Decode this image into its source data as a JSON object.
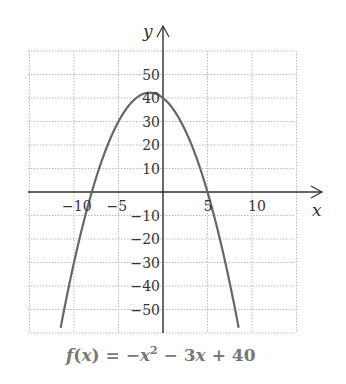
{
  "chart_data": {
    "type": "line",
    "title": "",
    "caption": "f(x) = −x² − 3x + 40",
    "function": "f(x) = -x^2 - 3x + 40",
    "xlabel": "x",
    "ylabel": "y",
    "xlim": [
      -15,
      15
    ],
    "ylim": [
      -60,
      60
    ],
    "x_ticks": [
      -10,
      -5,
      5,
      10
    ],
    "x_tick_labels": [
      "−10",
      "−5",
      "5",
      "10"
    ],
    "y_ticks": [
      50,
      40,
      30,
      20,
      10,
      -10,
      -20,
      -30,
      -40,
      -50
    ],
    "y_tick_labels": [
      "50",
      "40",
      "30",
      "20",
      "10",
      "−10",
      "−20",
      "−30",
      "−40",
      "−50"
    ],
    "grid": true,
    "grid_style": "dotted",
    "grid_x_step": 5,
    "grid_y_step": 10,
    "legend": null,
    "series": [
      {
        "name": "f(x) = -x^2 - 3x + 40",
        "color": "#666666",
        "x": [
          -11.5,
          -10,
          -8,
          -6,
          -4,
          -3,
          -1.5,
          0,
          2,
          4,
          5,
          6,
          8.5
        ],
        "values": [
          -57.75,
          -30,
          0,
          22,
          36,
          40,
          42.25,
          40,
          30,
          12,
          0,
          -14,
          -57.75
        ]
      }
    ],
    "vertex": {
      "x": -1.5,
      "y": 42.25
    },
    "roots": [
      -8,
      5
    ],
    "y_intercept": 40
  },
  "labels": {
    "x_axis": "x",
    "y_axis": "y",
    "caption": "f(x) = −x² − 3x + 40"
  },
  "colors": {
    "axis": "#333333",
    "grid": "#bbbbbb",
    "curve": "#666666",
    "caption": "#777777"
  }
}
